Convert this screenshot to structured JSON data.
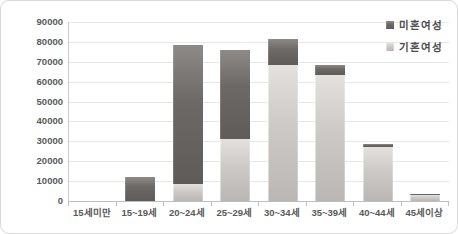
{
  "chart_data": {
    "type": "bar",
    "stacked": true,
    "title": "",
    "xlabel": "",
    "ylabel": "",
    "categories": [
      "15세미만",
      "15~19세",
      "20~24세",
      "25~29세",
      "30~34세",
      "35~39세",
      "40~44세",
      "45세이상"
    ],
    "series": [
      {
        "name": "기혼여성",
        "color": "#c9c5c3",
        "values": [
          0,
          0,
          8500,
          31000,
          68500,
          63500,
          27000,
          3000
        ]
      },
      {
        "name": "미혼여성",
        "color": "#6b6765",
        "values": [
          0,
          12000,
          70000,
          45000,
          13000,
          5000,
          1500,
          300
        ]
      }
    ],
    "ylim": [
      0,
      90000
    ],
    "ytick_interval": 10000,
    "yticks": [
      "90000",
      "80000",
      "70000",
      "60000",
      "50000",
      "40000",
      "30000",
      "20000",
      "10000",
      "0"
    ],
    "grid": true,
    "legend_position": "top-right"
  },
  "legend": {
    "items": [
      {
        "label": "미혼여성",
        "color": "#6b6765",
        "series_class": "seg-unmarried"
      },
      {
        "label": "기혼여성",
        "color": "#c9c5c3",
        "series_class": "seg-married"
      }
    ]
  }
}
